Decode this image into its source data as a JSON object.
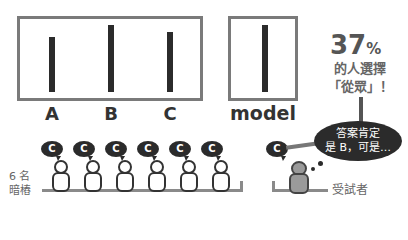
{
  "comparison": {
    "lines": [
      {
        "label": "A",
        "height": 55
      },
      {
        "label": "B",
        "height": 67
      },
      {
        "label": "C",
        "height": 60
      }
    ]
  },
  "model": {
    "label": "model",
    "height": 67
  },
  "stat": {
    "percent_number": "37",
    "percent_sign": "%",
    "line1": "的人選擇",
    "line2": "「從眾」！"
  },
  "confederates": {
    "label_line1": "6 名",
    "label_line2": "暗樁",
    "count": 6,
    "answer": "C"
  },
  "subject": {
    "label": "受試者",
    "answer": "C",
    "thought_line1": "答案肯定",
    "thought_line2": "是 B，可是…"
  },
  "colors": {
    "frame": "#7a7a7a",
    "bar": "#2b2b2b",
    "subject_fill": "#9a9a9a",
    "bench": "#8a8a8a"
  }
}
